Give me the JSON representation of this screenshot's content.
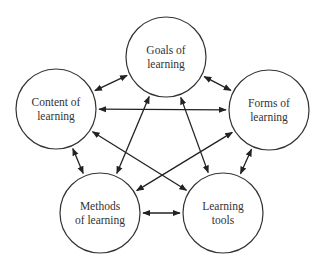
{
  "diagram": {
    "type": "concept-network",
    "nodes": [
      {
        "id": "goals",
        "lines": [
          "Goals of",
          "learning"
        ],
        "cx": 166,
        "cy": 57,
        "r": 40
      },
      {
        "id": "content",
        "lines": [
          "Content of",
          "learning"
        ],
        "cx": 56,
        "cy": 109,
        "r": 40
      },
      {
        "id": "forms",
        "lines": [
          "Forms of",
          "learning"
        ],
        "cx": 269,
        "cy": 110,
        "r": 40
      },
      {
        "id": "methods",
        "lines": [
          "Methods",
          "of learning"
        ],
        "cx": 100,
        "cy": 213,
        "r": 40
      },
      {
        "id": "tools",
        "lines": [
          "Learning",
          "tools"
        ],
        "cx": 223,
        "cy": 213,
        "r": 40
      }
    ],
    "edges": [
      {
        "from": "goals",
        "to": "content",
        "direction": "both"
      },
      {
        "from": "goals",
        "to": "forms",
        "direction": "both"
      },
      {
        "from": "goals",
        "to": "methods",
        "direction": "both"
      },
      {
        "from": "goals",
        "to": "tools",
        "direction": "both"
      },
      {
        "from": "content",
        "to": "forms",
        "direction": "both"
      },
      {
        "from": "content",
        "to": "methods",
        "direction": "both"
      },
      {
        "from": "content",
        "to": "tools",
        "direction": "both"
      },
      {
        "from": "forms",
        "to": "methods",
        "direction": "both"
      },
      {
        "from": "forms",
        "to": "tools",
        "direction": "both"
      },
      {
        "from": "methods",
        "to": "tools",
        "direction": "both"
      }
    ],
    "colors": {
      "stroke": "#333333",
      "arrow": "#222222",
      "text": "#333333",
      "background": "#ffffff"
    }
  }
}
